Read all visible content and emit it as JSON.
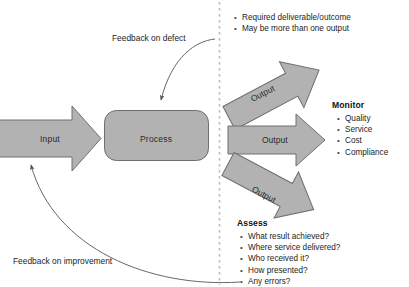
{
  "diagram": {
    "colors": {
      "shape_fill": "#b2b2b2",
      "shape_stroke": "#6e6e6e",
      "line": "#5a5a5a",
      "divider": "#b9b9b9",
      "text": "#1d1d1d"
    },
    "shapes": {
      "input_label": "Input",
      "process_label": "Process"
    },
    "outputs": [
      {
        "label": "Output",
        "direction": "up-right"
      },
      {
        "label": "Output",
        "direction": "right"
      },
      {
        "label": "Output",
        "direction": "down-right"
      }
    ],
    "output_notes": {
      "items": [
        "Required deliverable/outcome",
        "May be more than one output"
      ]
    },
    "monitor": {
      "heading": "Monitor",
      "items": [
        "Quality",
        "Service",
        "Cost",
        "Compliance"
      ]
    },
    "assess": {
      "heading": "Assess",
      "items": [
        "What result achieved?",
        "Where service delivered?",
        "Who received it?",
        "How presented?",
        "Any errors?"
      ]
    },
    "feedback": {
      "defect": "Feedback on defect",
      "improvement": "Feedback on improvement"
    }
  }
}
